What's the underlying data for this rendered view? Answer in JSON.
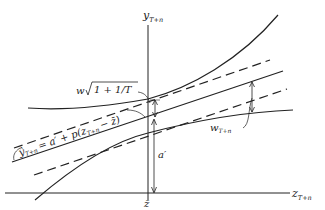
{
  "figure": {
    "type": "regression-prediction-interval-diagram",
    "y_axis_label": "y",
    "y_axis_subscript": "T+n",
    "x_axis_label": "z",
    "x_axis_subscript": "T+n",
    "x_mean_label": "z̄",
    "intercept_label": "a′",
    "regression_equation_lhs": "ŷ",
    "regression_equation_lhs_subscript": "T+n",
    "regression_equation_rhs": "= a′ + p(z",
    "regression_equation_rhs_subscript": "T+n",
    "regression_equation_tail": "− z̄)",
    "min_width_label_prefix": "w",
    "min_width_label_sqrt": "1 + 1/T",
    "width_label": "w",
    "width_label_subscript": "T+n",
    "colors": {
      "line": "#222222",
      "background": "#ffffff"
    }
  }
}
